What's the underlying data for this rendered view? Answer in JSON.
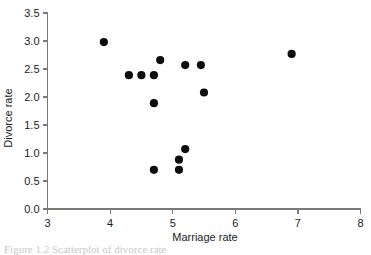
{
  "figure": {
    "background_color": "#ffffff",
    "point_color": "#0d0d0d",
    "axis_color": "#7a7a7a",
    "caption_partial": "Figure 1.2  Scatterplot of divorce rate"
  },
  "chart_data": {
    "type": "scatter",
    "title": "",
    "xlabel": "Marriage rate",
    "ylabel": "Divorce rate",
    "xlim": [
      3,
      8
    ],
    "ylim": [
      0.0,
      3.5
    ],
    "xticks": [
      3,
      4,
      5,
      6,
      7,
      8
    ],
    "xtick_labels": [
      "3",
      "4",
      "5",
      "6",
      "7",
      "8"
    ],
    "yticks": [
      0.0,
      0.5,
      1.0,
      1.5,
      2.0,
      2.5,
      3.0,
      3.5
    ],
    "ytick_labels": [
      "0.0",
      "0.5",
      "1.0",
      "1.5",
      "2.0",
      "2.5",
      "3.0",
      "3.5"
    ],
    "grid": false,
    "legend": null,
    "marker": "filled-circle",
    "marker_size": 5,
    "points": [
      {
        "x": 3.9,
        "y": 2.98
      },
      {
        "x": 4.3,
        "y": 2.39
      },
      {
        "x": 4.5,
        "y": 2.39
      },
      {
        "x": 4.7,
        "y": 2.39
      },
      {
        "x": 4.8,
        "y": 2.66
      },
      {
        "x": 4.7,
        "y": 1.89
      },
      {
        "x": 4.7,
        "y": 0.7
      },
      {
        "x": 5.1,
        "y": 0.7
      },
      {
        "x": 5.1,
        "y": 0.88
      },
      {
        "x": 5.2,
        "y": 1.07
      },
      {
        "x": 5.2,
        "y": 2.57
      },
      {
        "x": 5.45,
        "y": 2.57
      },
      {
        "x": 5.5,
        "y": 2.08
      },
      {
        "x": 6.9,
        "y": 2.77
      }
    ]
  }
}
